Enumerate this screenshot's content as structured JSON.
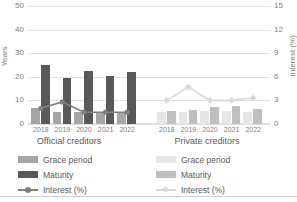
{
  "chart_data": {
    "type": "bar",
    "title": "",
    "subtitle": "",
    "ylabel": "Years",
    "ylabel_right": "Interest (%)",
    "xlabel": "",
    "ylim": [
      0,
      50
    ],
    "ylim_right": [
      0,
      15
    ],
    "yticks": [
      50,
      40,
      30,
      20,
      10,
      0
    ],
    "yticks_right": [
      15,
      12,
      9,
      6,
      3,
      0
    ],
    "grid": true,
    "legend_position": "bottom",
    "categories": [
      "2018",
      "2019",
      "2020",
      "2021",
      "2022"
    ],
    "groups": [
      {
        "name": "Official creditors",
        "series": [
          {
            "name": "Grace period",
            "axis": "left",
            "type": "bar",
            "color": "#a6a6a6",
            "values": [
              6.7,
              5.0,
              5.0,
              5.0,
              5.0
            ]
          },
          {
            "name": "Maturity",
            "axis": "left",
            "type": "bar",
            "color": "#595959",
            "values": [
              25.0,
              19.3,
              22.5,
              20.5,
              22.0
            ]
          },
          {
            "name": "Interest (%)",
            "axis": "right",
            "type": "line",
            "color": "#808080",
            "marker": "circle",
            "values": [
              2.0,
              2.8,
              1.5,
              1.5,
              1.5
            ]
          }
        ]
      },
      {
        "name": "Private creditors",
        "series": [
          {
            "name": "Grace period",
            "axis": "left",
            "type": "bar",
            "color": "#e6e6e6",
            "values": [
              5.0,
              5.0,
              5.5,
              5.5,
              5.0
            ]
          },
          {
            "name": "Maturity",
            "axis": "left",
            "type": "bar",
            "color": "#bfbfbf",
            "values": [
              5.5,
              6.0,
              7.0,
              7.5,
              6.5
            ]
          },
          {
            "name": "Interest (%)",
            "axis": "right",
            "type": "line",
            "color": "#d9d9d9",
            "marker": "diamond",
            "values": [
              3.0,
              4.7,
              3.0,
              3.0,
              3.3
            ]
          }
        ]
      }
    ]
  },
  "axes": {
    "left": {
      "title": "Years",
      "ticks": [
        "50",
        "40",
        "30",
        "20",
        "10",
        "0"
      ]
    },
    "right": {
      "title": "Interest (%)",
      "ticks": [
        "15",
        "12",
        "9",
        "6",
        "3",
        "0"
      ]
    }
  },
  "groups": {
    "official": {
      "title": "Official creditors",
      "xticks": [
        "2018",
        "2019",
        "2020",
        "2021",
        "2022"
      ],
      "legend": [
        {
          "label": "Grace period",
          "color": "#a6a6a6",
          "kind": "bar"
        },
        {
          "label": "Maturity",
          "color": "#595959",
          "kind": "bar"
        },
        {
          "label": "Interest (%)",
          "color": "#808080",
          "kind": "line"
        }
      ]
    },
    "private": {
      "title": "Private creditors",
      "xticks": [
        "2018",
        "2019",
        "2020",
        "2021",
        "2022"
      ],
      "legend": [
        {
          "label": "Grace period",
          "color": "#e6e6e6",
          "kind": "bar"
        },
        {
          "label": "Maturity",
          "color": "#bfbfbf",
          "kind": "bar"
        },
        {
          "label": "Interest (%)",
          "color": "#d9d9d9",
          "kind": "line"
        }
      ]
    }
  },
  "colors": {
    "grid": "#e0e0e0",
    "text": "#595959",
    "tick_text": "#808080"
  }
}
